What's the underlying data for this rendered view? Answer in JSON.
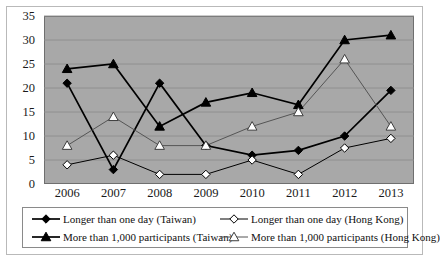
{
  "chart_data": {
    "type": "line",
    "title": "",
    "xlabel": "",
    "ylabel": "",
    "categories": [
      "2006",
      "2007",
      "2008",
      "2009",
      "2010",
      "2011",
      "2012",
      "2013"
    ],
    "ylim": [
      0,
      35
    ],
    "ytick_step": 5,
    "yticks": [
      0,
      5,
      10,
      15,
      20,
      25,
      30,
      35
    ],
    "grid": true,
    "legend_position": "bottom",
    "plot_background": "#a8a8a8",
    "series": [
      {
        "name": "Longer than one day (Taiwan)",
        "marker": "filled-diamond",
        "color": "#000000",
        "values": [
          21,
          3,
          21,
          8,
          6,
          7,
          10,
          19.5
        ]
      },
      {
        "name": "Longer than one day (Hong Kong)",
        "marker": "open-diamond",
        "color": "#000000",
        "values": [
          4,
          6,
          2,
          2,
          5,
          2,
          7.5,
          9.5
        ]
      },
      {
        "name": "More than 1,000 participants (Taiwan)",
        "marker": "filled-triangle",
        "color": "#000000",
        "values": [
          24,
          25,
          12,
          17,
          19,
          16.5,
          30,
          31
        ]
      },
      {
        "name": "More than 1,000 participants (Hong Kong)",
        "marker": "open-triangle",
        "color": "#555555",
        "values": [
          8,
          14,
          8,
          8,
          12,
          15,
          26,
          12
        ]
      }
    ]
  },
  "legend": {
    "entries": [
      {
        "label": "Longer than one day (Taiwan)",
        "marker": "filled-diamond"
      },
      {
        "label": "Longer than one day (Hong Kong)",
        "marker": "open-diamond"
      },
      {
        "label": "More than 1,000 participants  (Taiwan)",
        "marker": "filled-triangle"
      },
      {
        "label": "More than 1,000 participants (Hong Kong)",
        "marker": "open-triangle"
      }
    ]
  }
}
